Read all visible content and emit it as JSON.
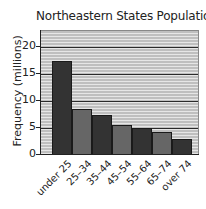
{
  "chart_data": {
    "type": "bar",
    "title": "Northeastern States Population",
    "xlabel": "",
    "ylabel": "Frequency (millions)",
    "categories": [
      "under 25",
      "25–34",
      "35–44",
      "45–54",
      "55–64",
      "65–74",
      "over 74"
    ],
    "values": [
      17.2,
      8.4,
      7.3,
      5.4,
      4.9,
      4.0,
      2.7
    ],
    "ylim": [
      0,
      23
    ],
    "yticks": [
      0,
      5,
      10,
      15,
      20
    ],
    "grid": true,
    "legend": null,
    "bar_colors": [
      "#333333",
      "#666666",
      "#333333",
      "#666666",
      "#333333",
      "#666666",
      "#333333"
    ],
    "background": "#bfbfbf"
  }
}
